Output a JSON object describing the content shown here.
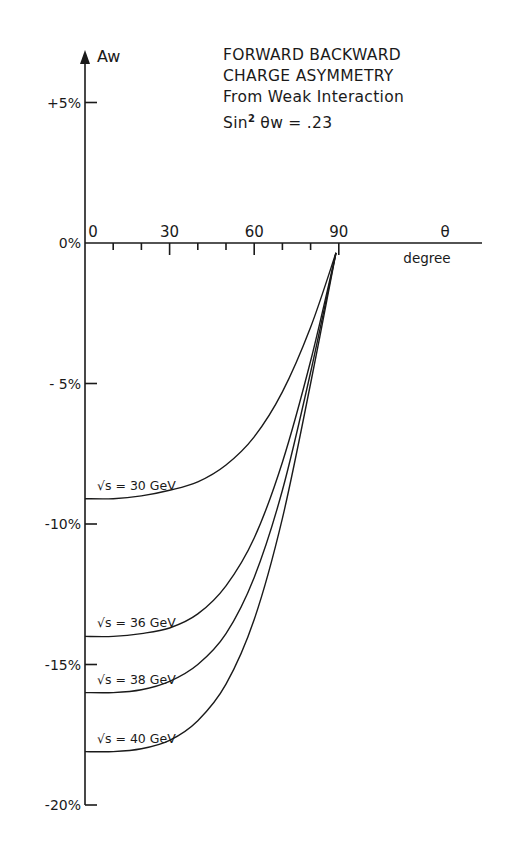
{
  "chart_data": {
    "type": "line",
    "title": "FORWARD BACKWARD CHARGE ASYMMETRY",
    "subtitle": "From Weak Interaction",
    "annotation": "Sin² θw = .23",
    "xlabel": "θ",
    "xlabel_unit": "degree",
    "ylabel": "Aw",
    "x_ticks": [
      "0",
      "30",
      "60",
      "90"
    ],
    "x_minor_step": 10,
    "y_ticks": [
      "+5%",
      "0%",
      "- 5%",
      "-10%",
      "-15%",
      "-20%"
    ],
    "xlim": [
      0,
      135
    ],
    "ylim": [
      -20,
      7
    ],
    "grid": false,
    "legend_position": "inline labels",
    "x": [
      0,
      10,
      20,
      30,
      40,
      50,
      60,
      70,
      80,
      90
    ],
    "series": [
      {
        "name": "√s = 30 GeV",
        "values": [
          -9.1,
          -9.1,
          -9.0,
          -8.8,
          -8.5,
          -7.9,
          -6.9,
          -5.3,
          -3.0,
          0
        ]
      },
      {
        "name": "√s = 36 GeV",
        "values": [
          -14.0,
          -14.0,
          -13.9,
          -13.7,
          -13.2,
          -12.2,
          -10.5,
          -7.8,
          -4.2,
          0
        ]
      },
      {
        "name": "√s = 38 GeV",
        "values": [
          -16.0,
          -16.0,
          -15.9,
          -15.6,
          -15.0,
          -13.9,
          -11.9,
          -8.8,
          -4.6,
          0
        ]
      },
      {
        "name": "√s = 40 GeV",
        "values": [
          -18.1,
          -18.1,
          -18.0,
          -17.7,
          -17.0,
          -15.7,
          -13.4,
          -9.8,
          -5.0,
          0
        ]
      }
    ]
  },
  "title_lines": {
    "line1": "FORWARD BACKWARD",
    "line2": "CHARGE ASYMMETRY",
    "line3": "From Weak Interaction",
    "line4_prefix": "Sin",
    "line4_sup": "2",
    "line4_suffix": " θw = .23"
  },
  "axis": {
    "y_label": "Aw",
    "x_symbol": "θ",
    "x_unit": "degree"
  },
  "curve_labels": [
    "√s = 30 GeV",
    "√s = 36 GeV",
    "√s = 38 GeV",
    "√s = 40 GeV"
  ]
}
